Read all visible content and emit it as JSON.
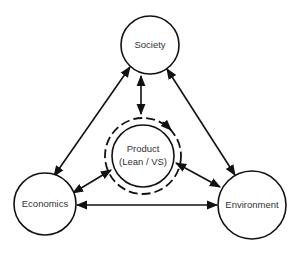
{
  "diagram": {
    "type": "relationship-diagram",
    "nodes": [
      {
        "id": "society",
        "label": "Society"
      },
      {
        "id": "product",
        "label_line1": "Product",
        "label_line2": "(Lean / VS)"
      },
      {
        "id": "economics",
        "label": "Economics"
      },
      {
        "id": "environment",
        "label": "Environment"
      }
    ],
    "edges": [
      {
        "from": "society",
        "to": "economics",
        "direction": "both"
      },
      {
        "from": "society",
        "to": "environment",
        "direction": "both"
      },
      {
        "from": "society",
        "to": "product",
        "direction": "both"
      },
      {
        "from": "product",
        "to": "economics",
        "direction": "both"
      },
      {
        "from": "product",
        "to": "environment",
        "direction": "both"
      },
      {
        "from": "economics",
        "to": "environment",
        "direction": "both"
      }
    ],
    "product_cycle": {
      "style": "dashed-circle",
      "arrow": "clockwise"
    },
    "colors": {
      "stroke": "#111111",
      "text": "#333333",
      "background": "#ffffff"
    }
  }
}
